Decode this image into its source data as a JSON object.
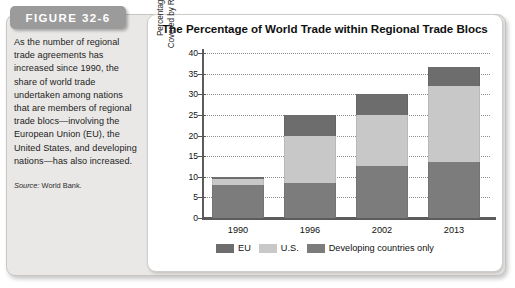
{
  "figure": {
    "badge_label": "FIGURE 32-6",
    "caption": "As the number of regional trade agreements has increased since 1990, the share of world trade undertaken among nations that are members of regional trade blocs—involving the European Union (EU), the United States, and developing nations—has also increased.",
    "source_prefix": "Source:",
    "source_text": "World Bank."
  },
  "chart_data": {
    "type": "bar",
    "stacked": true,
    "title": "The Percentage of World Trade within Regional Trade Blocs",
    "xlabel": "",
    "ylabel": "Percentage of World Trade Covered by Regional Agreements",
    "ylabel_line1": "Percentage of World Trade",
    "ylabel_line2": "Covered by Regional Agreements",
    "categories": [
      "1990",
      "1996",
      "2002",
      "2013"
    ],
    "ylim": [
      0,
      40
    ],
    "yticks": [
      0,
      5,
      10,
      15,
      20,
      25,
      30,
      35,
      40
    ],
    "grid": true,
    "legend_position": "bottom",
    "series": [
      {
        "name": "Developing countries only",
        "color": "#7c7c7c",
        "values": [
          8.0,
          8.5,
          12.5,
          13.5
        ]
      },
      {
        "name": "U.S.",
        "color": "#c8c8c8",
        "values": [
          1.5,
          11.5,
          12.5,
          18.5
        ]
      },
      {
        "name": "EU",
        "color": "#6d6d6d",
        "values": [
          0.5,
          5.0,
          5.0,
          4.5
        ]
      }
    ],
    "totals": [
      10.0,
      25.0,
      30.0,
      36.5
    ]
  },
  "colors": {
    "eu": "#6d6d6d",
    "us": "#c8c8c8",
    "developing": "#7c7c7c",
    "badge": "#9b9b9b",
    "panel": "#e9e8e6"
  }
}
